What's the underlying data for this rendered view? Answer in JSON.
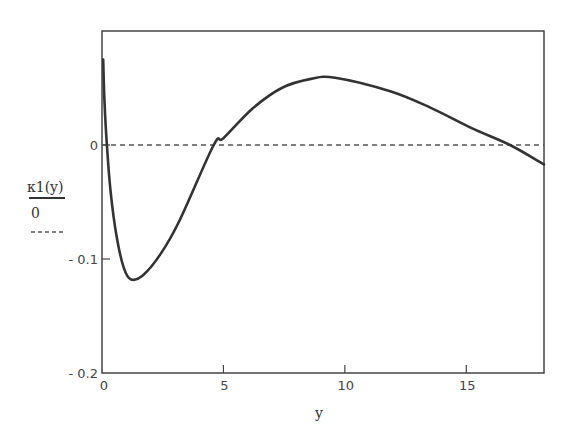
{
  "chart_data": {
    "type": "line",
    "title": "",
    "xlabel": "y",
    "ylabel": "κ1(y)",
    "xlim": [
      0,
      18.2
    ],
    "ylim": [
      -0.2,
      0.1
    ],
    "x_ticks": [
      0,
      5,
      10,
      15
    ],
    "x_tick_labels": [
      "0",
      "5",
      "10",
      "15"
    ],
    "y_ticks": [
      0,
      -0.1,
      -0.2
    ],
    "y_tick_labels": [
      "0",
      "- 0.1",
      "- 0.2"
    ],
    "grid": false,
    "legend": {
      "position": "left",
      "entries": [
        {
          "label": "κ1(y)",
          "style": "solid"
        },
        {
          "label": "0",
          "style": "dashed"
        }
      ]
    },
    "series": [
      {
        "name": "κ1(y)",
        "style": "solid",
        "color": "#333333",
        "x": [
          0.05,
          0.1,
          0.2,
          0.35,
          0.6,
          0.9,
          1.2,
          1.7,
          2.4,
          3.2,
          4.6,
          5.0,
          6.2,
          7.4,
          8.6,
          9.6,
          11.9,
          13.5,
          15.2,
          16.8,
          18.2
        ],
        "y": [
          0.075,
          0.04,
          0.0,
          -0.04,
          -0.08,
          -0.108,
          -0.118,
          -0.114,
          -0.096,
          -0.066,
          0.0,
          0.006,
          0.032,
          0.05,
          0.058,
          0.059,
          0.047,
          0.033,
          0.015,
          0.0,
          -0.017
        ]
      },
      {
        "name": "0",
        "style": "dashed",
        "color": "#555555",
        "x": [
          0,
          18.2
        ],
        "y": [
          0,
          0
        ]
      }
    ]
  },
  "legend": {
    "series_label": "κ1(y)",
    "zero_label": "0"
  },
  "axes": {
    "xlabel": "y",
    "x_tick_labels": [
      "0",
      "5",
      "10",
      "15"
    ],
    "y_tick_labels": [
      "0",
      "- 0.1",
      "- 0.2"
    ]
  }
}
